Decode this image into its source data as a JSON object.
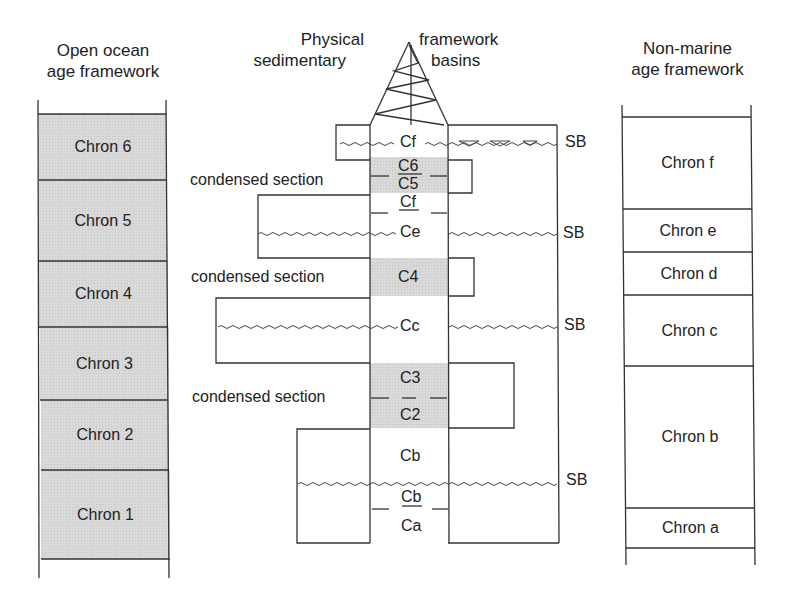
{
  "left_column": {
    "title_line1": "Open ocean",
    "title_line2": "age framework",
    "chrons": [
      {
        "label": "Chron 6",
        "top": 114,
        "bottom": 180
      },
      {
        "label": "Chron 5",
        "top": 180,
        "bottom": 261
      },
      {
        "label": "Chron 4",
        "top": 261,
        "bottom": 327
      },
      {
        "label": "Chron 3",
        "top": 327,
        "bottom": 400
      },
      {
        "label": "Chron 2",
        "top": 400,
        "bottom": 470
      },
      {
        "label": "Chron 1",
        "top": 470,
        "bottom": 559
      }
    ],
    "fill": "#d9d9d9"
  },
  "center_column": {
    "title_left_line1": "Physical",
    "title_left_line2": "sedimentary",
    "title_right_line1": "framework",
    "title_right_line2": "basins",
    "well_units": {
      "cf_top": "Cf",
      "c6": "C6",
      "c5": "C5",
      "cf_lower": "Cf",
      "ce": "Ce",
      "c4": "C4",
      "cc": "Cc",
      "c3": "C3",
      "c2": "C2",
      "cb_upper": "Cb",
      "cb_lower": "Cb",
      "ca": "Ca"
    },
    "condensed_sections": [
      {
        "label": "condensed section"
      },
      {
        "label": "condensed section"
      },
      {
        "label": "condensed section"
      }
    ],
    "sequence_boundaries": [
      {
        "label": "SB"
      },
      {
        "label": "SB"
      },
      {
        "label": "SB"
      },
      {
        "label": "SB"
      }
    ]
  },
  "right_column": {
    "title_line1": "Non-marine",
    "title_line2": "age framework",
    "chrons": [
      {
        "label": "Chron f",
        "top": 117,
        "bottom": 209
      },
      {
        "label": "Chron e",
        "top": 209,
        "bottom": 252
      },
      {
        "label": "Chron d",
        "top": 252,
        "bottom": 295
      },
      {
        "label": "Chron c",
        "top": 295,
        "bottom": 366
      },
      {
        "label": "Chron b",
        "top": 366,
        "bottom": 508
      },
      {
        "label": "Chron a",
        "top": 508,
        "bottom": 548
      }
    ]
  },
  "colors": {
    "line": "#333333",
    "shade": "#d9d9d9",
    "text": "#222222"
  }
}
